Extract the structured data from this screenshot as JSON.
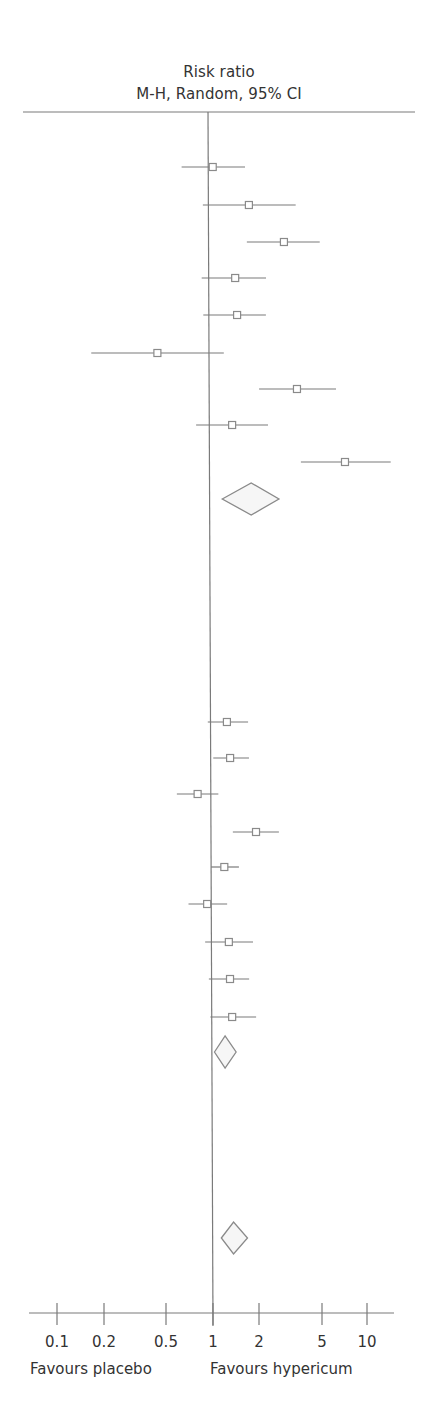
{
  "chart_data": {
    "type": "forest",
    "title": "Risk ratio",
    "subtitle": "M-H, Random, 95% CI",
    "xscale": "log",
    "xlim": [
      0.06,
      25
    ],
    "reference_line": 1,
    "ticks": [
      0.1,
      0.2,
      0.5,
      1,
      2,
      5,
      10
    ],
    "tick_labels": [
      "0.1",
      "0.2",
      "0.5",
      "1",
      "2",
      "5",
      "10"
    ],
    "xlabel_left": "Favours placebo",
    "xlabel_right": "Favours hypericum",
    "grid": false,
    "groups": [
      {
        "name": "Subgroup 1",
        "studies": [
          {
            "rr": 1.07,
            "lo": 0.67,
            "hi": 1.74,
            "y": 167
          },
          {
            "rr": 1.84,
            "lo": 0.92,
            "hi": 3.72,
            "y": 205
          },
          {
            "rr": 3.11,
            "lo": 1.78,
            "hi": 5.33,
            "y": 242
          },
          {
            "rr": 1.49,
            "lo": 0.9,
            "hi": 2.37,
            "y": 278
          },
          {
            "rr": 1.53,
            "lo": 0.92,
            "hi": 2.36,
            "y": 315
          },
          {
            "rr": 0.46,
            "lo": 0.17,
            "hi": 1.25,
            "y": 353
          },
          {
            "rr": 3.75,
            "lo": 2.12,
            "hi": 6.75,
            "y": 389
          },
          {
            "rr": 1.41,
            "lo": 0.82,
            "hi": 2.42,
            "y": 425
          },
          {
            "rr": 7.69,
            "lo": 3.96,
            "hi": 15.3,
            "y": 462
          }
        ],
        "pooled": {
          "rr": 1.87,
          "lo": 1.21,
          "hi": 2.84,
          "y": 499,
          "half_height": 16
        }
      },
      {
        "name": "Subgroup 2",
        "studies": [
          {
            "rr": 1.28,
            "lo": 0.96,
            "hi": 1.76,
            "y": 722
          },
          {
            "rr": 1.34,
            "lo": 1.04,
            "hi": 1.78,
            "y": 758
          },
          {
            "rr": 0.82,
            "lo": 0.6,
            "hi": 1.12,
            "y": 794
          },
          {
            "rr": 1.97,
            "lo": 1.39,
            "hi": 2.78,
            "y": 832
          },
          {
            "rr": 1.22,
            "lo": 1.0,
            "hi": 1.52,
            "y": 867
          },
          {
            "rr": 0.94,
            "lo": 0.71,
            "hi": 1.27,
            "y": 904
          },
          {
            "rr": 1.3,
            "lo": 0.91,
            "hi": 1.87,
            "y": 942
          },
          {
            "rr": 1.32,
            "lo": 0.96,
            "hi": 1.76,
            "y": 979
          },
          {
            "rr": 1.36,
            "lo": 0.98,
            "hi": 1.95,
            "y": 1017
          }
        ],
        "pooled": {
          "rr": 1.22,
          "lo": 1.04,
          "hi": 1.44,
          "y": 1052,
          "half_height": 16
        }
      }
    ],
    "overall": {
      "rr": 1.37,
      "lo": 1.14,
      "hi": 1.69,
      "y": 1238,
      "half_height": 16
    }
  },
  "header": {
    "line1": "Risk ratio",
    "line2": "M-H, Random, 95% CI"
  },
  "axis": {
    "ticks": [
      {
        "label": "0.1",
        "x": 57
      },
      {
        "label": "0.2",
        "x": 104
      },
      {
        "label": "0.5",
        "x": 166
      },
      {
        "label": "1",
        "x": 213
      },
      {
        "label": "2",
        "x": 259
      },
      {
        "label": "5",
        "x": 322
      },
      {
        "label": "10",
        "x": 367
      }
    ],
    "favours_left": "Favours placebo",
    "favours_right": "Favours hypericum"
  },
  "colors": {
    "line": "#7a7a7a",
    "box": "#8a8a8a",
    "diamond_stroke": "#8a8a8a",
    "diamond_fill": "#f6f6f6",
    "text": "#333333"
  }
}
